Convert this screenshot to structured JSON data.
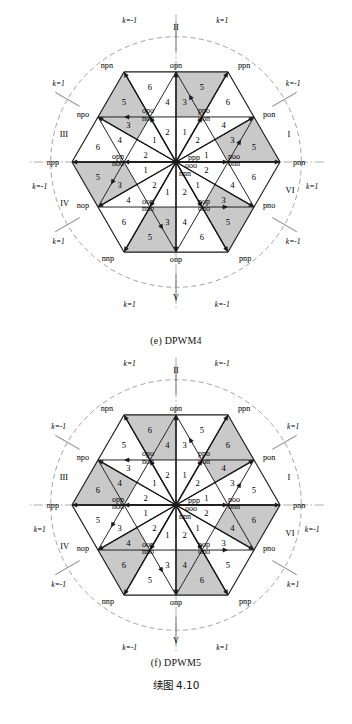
{
  "figure": {
    "caption_e": "(e) DPWM4",
    "caption_f": "(f) DPWM5",
    "caption_cn": "续图 4.10",
    "shade_color": "#c9c9c9",
    "line_color": "#1a1a1a",
    "axis_color": "#8a8a8a"
  },
  "labels": {
    "outer_vertices": [
      {
        "id": "pnn",
        "text": "pnn",
        "angle": 0
      },
      {
        "id": "ppn",
        "text": "ppn",
        "angle": 60
      },
      {
        "id": "npn",
        "text": "npn",
        "angle": 120
      },
      {
        "id": "npp",
        "text": "npp",
        "angle": 180
      },
      {
        "id": "nnp",
        "text": "nnp",
        "angle": 240
      },
      {
        "id": "pnp",
        "text": "pnp",
        "angle": 300
      }
    ],
    "mid_vertices": [
      {
        "id": "pon",
        "text": "pon",
        "angle": 30
      },
      {
        "id": "opn",
        "text": "opn",
        "angle": 90
      },
      {
        "id": "npo",
        "text": "npo",
        "angle": 150
      },
      {
        "id": "nop",
        "text": "nop",
        "angle": 210
      },
      {
        "id": "onp",
        "text": "onp",
        "angle": 270
      },
      {
        "id": "pno",
        "text": "pno",
        "angle": 330
      }
    ],
    "inner_pairs": [
      {
        "id": "poo-onn",
        "top": "poo",
        "bottom": "onn",
        "angle": 0
      },
      {
        "id": "ppo-oon",
        "top": "ppo",
        "bottom": "oon",
        "angle": 60
      },
      {
        "id": "opo-non",
        "top": "opo",
        "bottom": "non",
        "angle": 120
      },
      {
        "id": "opp-noo",
        "top": "opp",
        "bottom": "noo",
        "angle": 180
      },
      {
        "id": "oop-nno",
        "top": "oop",
        "bottom": "nno",
        "angle": 240
      },
      {
        "id": "pop-ono",
        "top": "pop",
        "bottom": "ono",
        "angle": 300
      }
    ],
    "zero_vectors": {
      "p": "ppp",
      "o": "ooo",
      "n": "nnn"
    },
    "sectors": [
      "I",
      "II",
      "III",
      "IV",
      "V",
      "VI"
    ],
    "region_numbers": [
      "1",
      "2",
      "3",
      "4",
      "5",
      "6"
    ],
    "k_positive": "k=1",
    "k_negative": "k=-1"
  },
  "diagram_e": {
    "name": "DPWM4",
    "k_labels": [
      {
        "pos": "top-left",
        "value": "k=-1"
      },
      {
        "pos": "top-right",
        "value": "k=1"
      },
      {
        "pos": "upper-left",
        "value": "k=1"
      },
      {
        "pos": "upper-right",
        "value": "k=-1"
      },
      {
        "pos": "mid-left",
        "value": "k=-1"
      },
      {
        "pos": "mid-right",
        "value": "k=1"
      },
      {
        "pos": "lower-left",
        "value": "k=1"
      },
      {
        "pos": "lower-right",
        "value": "k=-1"
      },
      {
        "pos": "bottom-left",
        "value": "k=1"
      },
      {
        "pos": "bottom-right",
        "value": "k=-1"
      }
    ],
    "shaded_regions": [
      "sector1-r5",
      "sector1-r3",
      "sector2-r5",
      "sector2-r3",
      "sector3-r5",
      "sector3-r3",
      "sector4-r5",
      "sector4-r3",
      "sector5-r5",
      "sector5-r3",
      "sector6-r5",
      "sector6-r3"
    ]
  },
  "diagram_f": {
    "name": "DPWM5",
    "k_labels": [
      {
        "pos": "top-left",
        "value": "k=1"
      },
      {
        "pos": "top-right",
        "value": "k=-1"
      },
      {
        "pos": "upper-left",
        "value": "k=-1"
      },
      {
        "pos": "upper-right",
        "value": "k=1"
      },
      {
        "pos": "mid-left",
        "value": "k=1"
      },
      {
        "pos": "mid-right",
        "value": "k=-1"
      },
      {
        "pos": "lower-left",
        "value": "k=-1"
      },
      {
        "pos": "lower-right",
        "value": "k=1"
      },
      {
        "pos": "bottom-left",
        "value": "k=-1"
      },
      {
        "pos": "bottom-right",
        "value": "k=1"
      }
    ],
    "shaded_regions": [
      "sector1-r6",
      "sector1-r4",
      "sector2-r6",
      "sector2-r4",
      "sector3-r6",
      "sector3-r4",
      "sector4-r6",
      "sector4-r4",
      "sector5-r6",
      "sector5-r4",
      "sector6-r6",
      "sector6-r4"
    ]
  }
}
